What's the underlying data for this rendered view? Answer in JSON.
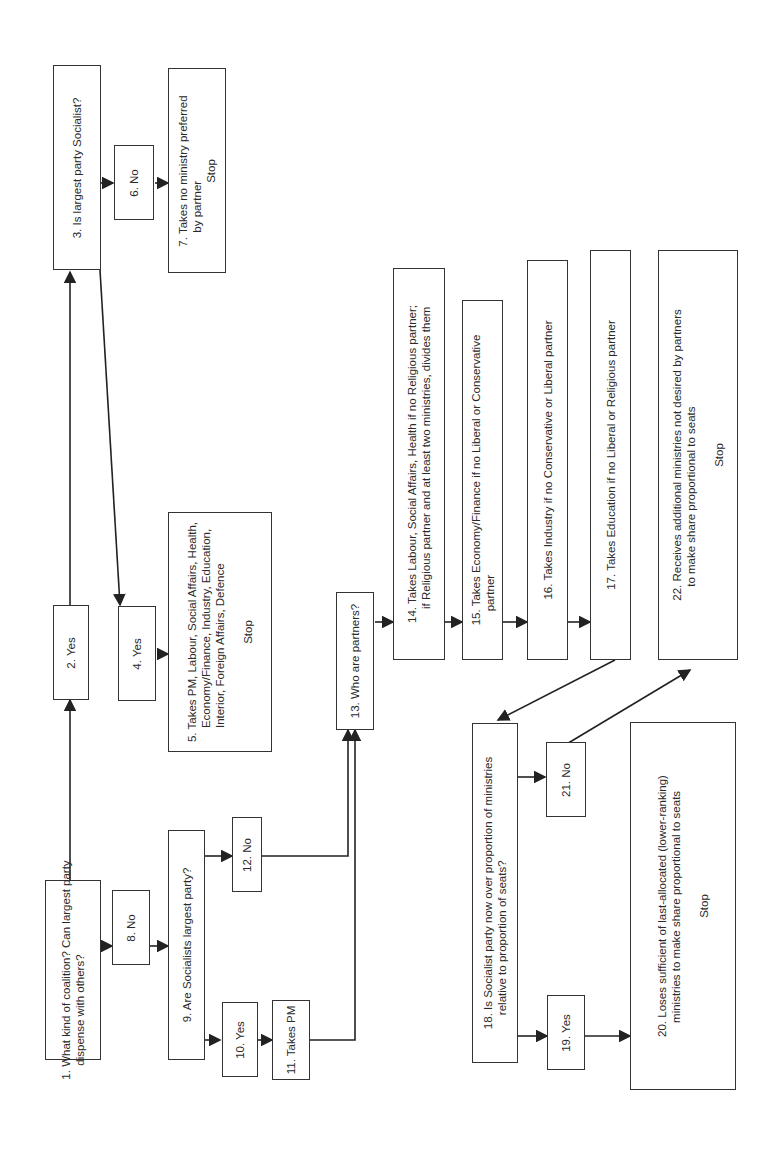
{
  "diagram": {
    "orientation": "rotated 90 degrees counter-clockwise",
    "nodes": [
      {
        "id": 1,
        "text": "1.  What kind of coalition? Can largest party",
        "text2": "dispense with others?"
      },
      {
        "id": 2,
        "text": "2.  Yes"
      },
      {
        "id": 3,
        "text": "3.  Is largest party Socialist?"
      },
      {
        "id": 4,
        "text": "4.  Yes"
      },
      {
        "id": 5,
        "text": "5.  Takes PM, Labour, Social Affairs, Health,",
        "text2": "Economy/Finance, Industry, Education,",
        "text3": "Interior, Foreign Affairs, Defence",
        "stop": "Stop"
      },
      {
        "id": 6,
        "text": "6.  No"
      },
      {
        "id": 7,
        "text": "7.  Takes no ministry preferred",
        "text2": "by partner",
        "stop": "Stop"
      },
      {
        "id": 8,
        "text": "8.  No"
      },
      {
        "id": 9,
        "text": "9.  Are Socialists largest party?"
      },
      {
        "id": 10,
        "text": "10.  Yes"
      },
      {
        "id": 11,
        "text": "11.  Takes PM"
      },
      {
        "id": 12,
        "text": "12.  No"
      },
      {
        "id": 13,
        "text": "13.  Who are partners?"
      },
      {
        "id": 14,
        "text": "14.  Takes Labour, Social Affairs, Health if no Religious partner;",
        "text2": "if Religious partner and at least two ministries, divides them"
      },
      {
        "id": 15,
        "text": "15.  Takes Economy/Finance if no Liberal or Conservative",
        "text2": "partner"
      },
      {
        "id": 16,
        "text": "16.  Takes Industry if no Conservative or Liberal partner"
      },
      {
        "id": 17,
        "text": "17.  Takes Education if no Liberal or Religious partner"
      },
      {
        "id": 18,
        "text": "18.  Is Socialist party now over proportion of ministries",
        "text2": "relative to proportion of seats?"
      },
      {
        "id": 19,
        "text": "19.  Yes"
      },
      {
        "id": 20,
        "text": "20.  Loses sufficient of last-allocated (lower-ranking)",
        "text2": "ministries to make share proportional to seats",
        "stop": "Stop"
      },
      {
        "id": 21,
        "text": "21.  No"
      },
      {
        "id": 22,
        "text": "22.  Receives additional ministries not desired by partners",
        "text2": "to make share proportional to seats",
        "stop": "Stop"
      }
    ],
    "edges": [
      [
        1,
        2
      ],
      [
        2,
        3
      ],
      [
        3,
        4
      ],
      [
        3,
        6
      ],
      [
        4,
        5
      ],
      [
        6,
        7
      ],
      [
        1,
        8
      ],
      [
        8,
        9
      ],
      [
        9,
        10
      ],
      [
        9,
        12
      ],
      [
        10,
        11
      ],
      [
        11,
        13
      ],
      [
        12,
        13
      ],
      [
        13,
        14
      ],
      [
        14,
        15
      ],
      [
        15,
        16
      ],
      [
        16,
        17
      ],
      [
        17,
        18
      ],
      [
        18,
        19
      ],
      [
        18,
        21
      ],
      [
        19,
        20
      ],
      [
        21,
        22
      ]
    ]
  }
}
